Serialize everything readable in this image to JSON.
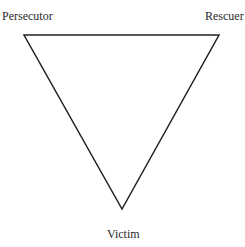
{
  "diagram": {
    "type": "drama-triangle",
    "shape": "inverted-triangle",
    "line_color": "#222222",
    "vertices": {
      "top_left": {
        "x": 24,
        "y": 35
      },
      "top_right": {
        "x": 219,
        "y": 35
      },
      "bottom": {
        "x": 122,
        "y": 209
      }
    },
    "labels": {
      "top_left": "Persecutor",
      "top_right": "Rescuer",
      "bottom": "Victim"
    }
  }
}
